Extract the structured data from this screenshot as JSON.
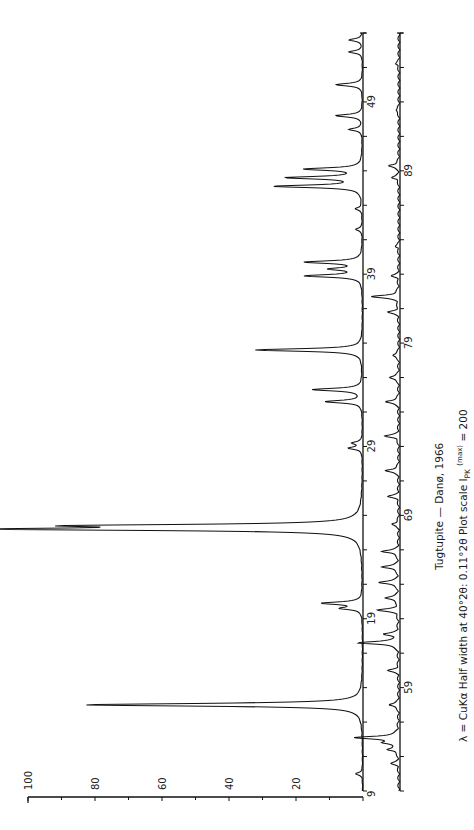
{
  "chart_data": {
    "type": "line",
    "title": "Tugtupite — Danø, 1966",
    "subtitle": "λ = CuKα   Half width at 40°2θ: 0.11°2θ   Plot scale I_PK (max) = 200",
    "xlabel": "2θ (degrees)",
    "ylabel": "Relative intensity",
    "orientation": "rotated-90",
    "ylim": [
      0,
      100
    ],
    "y_ticks": [
      20,
      40,
      60,
      80,
      100
    ],
    "panels": [
      {
        "name": "panel-1",
        "x_range": [
          9,
          53
        ],
        "x_tick_labels": [
          9,
          19,
          29,
          39,
          49
        ],
        "tick_step": 2
      },
      {
        "name": "panel-2",
        "x_range": [
          53,
          97
        ],
        "x_tick_labels": [
          59,
          69,
          79,
          89
        ],
        "tick_step": 2
      }
    ],
    "peaks_panel_1": [
      {
        "two_theta": 10.0,
        "intensity": 2
      },
      {
        "two_theta": 14.0,
        "intensity": 81
      },
      {
        "two_theta": 14.1,
        "intensity": 5
      },
      {
        "two_theta": 19.6,
        "intensity": 6
      },
      {
        "two_theta": 19.9,
        "intensity": 12
      },
      {
        "two_theta": 24.2,
        "intensity": 100
      },
      {
        "two_theta": 24.4,
        "intensity": 75
      },
      {
        "two_theta": 28.9,
        "intensity": 4
      },
      {
        "two_theta": 29.2,
        "intensity": 3
      },
      {
        "two_theta": 31.6,
        "intensity": 11
      },
      {
        "two_theta": 32.3,
        "intensity": 15
      },
      {
        "two_theta": 34.6,
        "intensity": 32
      },
      {
        "two_theta": 38.9,
        "intensity": 17
      },
      {
        "two_theta": 39.3,
        "intensity": 9
      },
      {
        "two_theta": 39.7,
        "intensity": 17
      },
      {
        "two_theta": 41.6,
        "intensity": 2
      },
      {
        "two_theta": 42.8,
        "intensity": 2
      },
      {
        "two_theta": 44.1,
        "intensity": 26
      },
      {
        "two_theta": 44.6,
        "intensity": 22
      },
      {
        "two_theta": 45.1,
        "intensity": 17
      },
      {
        "two_theta": 47.4,
        "intensity": 4
      },
      {
        "two_theta": 48.2,
        "intensity": 8
      },
      {
        "two_theta": 50.0,
        "intensity": 8
      },
      {
        "two_theta": 51.9,
        "intensity": 4
      },
      {
        "two_theta": 52.6,
        "intensity": 4
      }
    ],
    "peaks_panel_2": [
      {
        "two_theta": 54.6,
        "intensity": 2
      },
      {
        "two_theta": 55.4,
        "intensity": 3
      },
      {
        "two_theta": 55.8,
        "intensity": 4
      },
      {
        "two_theta": 56.1,
        "intensity": 13
      },
      {
        "two_theta": 58.0,
        "intensity": 3
      },
      {
        "two_theta": 60.0,
        "intensity": 3
      },
      {
        "two_theta": 61.6,
        "intensity": 12
      },
      {
        "two_theta": 62.1,
        "intensity": 4
      },
      {
        "two_theta": 63.5,
        "intensity": 6
      },
      {
        "two_theta": 64.2,
        "intensity": 4
      },
      {
        "two_theta": 65.1,
        "intensity": 6
      },
      {
        "two_theta": 66.0,
        "intensity": 5
      },
      {
        "two_theta": 66.9,
        "intensity": 5
      },
      {
        "two_theta": 68.5,
        "intensity": 2
      },
      {
        "two_theta": 70.1,
        "intensity": 3
      },
      {
        "two_theta": 71.6,
        "intensity": 4
      },
      {
        "two_theta": 73.6,
        "intensity": 4
      },
      {
        "two_theta": 75.6,
        "intensity": 4
      },
      {
        "two_theta": 77.0,
        "intensity": 3
      },
      {
        "two_theta": 78.3,
        "intensity": 2
      },
      {
        "two_theta": 80.8,
        "intensity": 3
      },
      {
        "two_theta": 81.7,
        "intensity": 8
      },
      {
        "two_theta": 82.9,
        "intensity": 2
      },
      {
        "two_theta": 84.6,
        "intensity": 1
      },
      {
        "two_theta": 88.6,
        "intensity": 2
      },
      {
        "two_theta": 89.3,
        "intensity": 3
      },
      {
        "two_theta": 92.5,
        "intensity": 1
      },
      {
        "two_theta": 95.2,
        "intensity": 1
      }
    ]
  },
  "captions": {
    "title": "Tugtupite — Danø, 1966",
    "line2_prefix": "λ = CuKα    Half width at 40°2θ: 0.11°2θ    Plot scale I",
    "line2_sub": "PK",
    "line2_sup": "(max)",
    "line2_suffix": " = 200"
  },
  "axis_labels": {
    "y": [
      "100",
      "80",
      "60",
      "40",
      "20"
    ],
    "panel1_x": [
      "9",
      "19",
      "29",
      "39",
      "49"
    ],
    "panel2_x": [
      "59",
      "69",
      "79",
      "89"
    ]
  }
}
